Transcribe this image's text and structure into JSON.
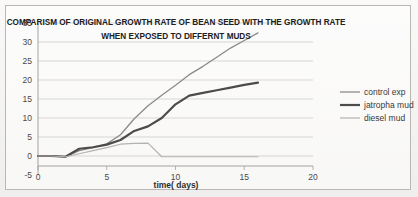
{
  "chart_data": {
    "type": "line",
    "title": "COMPARISM OF ORIGINAL GROWTH RATE OF BEAN SEED WITH  THE GROWTH RATE",
    "title_line2": "WHEN EXPOSED TO DIFFERNT MUDS",
    "xlabel": "time( days)",
    "ylabel": "",
    "xlim": [
      0,
      20
    ],
    "ylim": [
      -5,
      35
    ],
    "xticks": [
      "0",
      "5",
      "10",
      "15",
      "20"
    ],
    "xtick_values": [
      0,
      5,
      10,
      15,
      20
    ],
    "yticks": [
      "-5",
      "0",
      "5",
      "10",
      "15",
      "20",
      "25",
      "30",
      "35"
    ],
    "ytick_values": [
      -5,
      0,
      5,
      10,
      15,
      20,
      25,
      30,
      35
    ],
    "grid": "horizontal",
    "legend_position": "right",
    "series": [
      {
        "name": "control exp",
        "color": "#8d8b88",
        "width": 1.3,
        "x": [
          0,
          1,
          2,
          3,
          4,
          5,
          6,
          7,
          8,
          9,
          10,
          11,
          12,
          13,
          14,
          15,
          16
        ],
        "values": [
          0,
          0,
          -0.2,
          1.4,
          2.2,
          3.2,
          5.6,
          9.8,
          13.2,
          16.0,
          18.6,
          21.4,
          23.6,
          26.0,
          28.4,
          30.4,
          32.4
        ]
      },
      {
        "name": "jatropha mud",
        "color": "#4d4b49",
        "width": 2.2,
        "x": [
          0,
          1,
          2,
          3,
          4,
          5,
          6,
          7,
          8,
          9,
          10,
          11,
          12,
          13,
          14,
          15,
          16
        ],
        "values": [
          0,
          0,
          -0.2,
          1.9,
          2.3,
          3.0,
          4.2,
          6.6,
          7.8,
          10.0,
          13.6,
          15.9,
          16.6,
          17.3,
          18.0,
          18.7,
          19.3
        ]
      },
      {
        "name": "diesel mud",
        "color": "#b5b3b0",
        "width": 1.2,
        "x": [
          0,
          1,
          2,
          3,
          4,
          5,
          6,
          7,
          8,
          9,
          10,
          11,
          12,
          13,
          14,
          15,
          16
        ],
        "values": [
          0,
          0,
          -0.2,
          0.6,
          1.4,
          2.2,
          3.1,
          3.3,
          3.4,
          -0.2,
          -0.2,
          -0.2,
          -0.2,
          -0.2,
          -0.2,
          -0.2,
          -0.2
        ]
      }
    ]
  }
}
